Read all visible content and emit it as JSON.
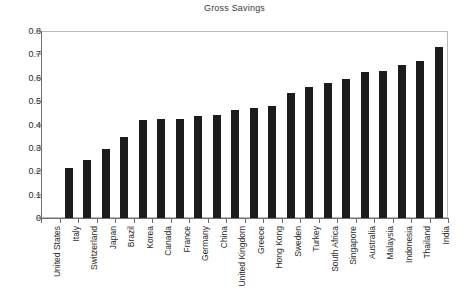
{
  "chart_data": {
    "type": "bar",
    "title": "Gross Savings",
    "xlabel": "",
    "ylabel": "",
    "ylim": [
      0,
      0.8
    ],
    "yticks": [
      0,
      0.1,
      0.2,
      0.3,
      0.4,
      0.5,
      0.6,
      0.7,
      0.8
    ],
    "ytick_labels": [
      "0",
      "0.1",
      "0.2",
      "0.3",
      "0.4",
      "0.5",
      "0.6",
      "0.7",
      "0.8"
    ],
    "grid": false,
    "legend": null,
    "bar_color": "#1c1c1c",
    "categories": [
      "United States",
      "Italy",
      "Switzerland",
      "Japan",
      "Brazil",
      "Korea",
      "Canada",
      "France",
      "Germany",
      "China",
      "United Kingdom",
      "Greece",
      "Hong Kong",
      "Sweden",
      "Turkey",
      "South Africa",
      "Singapore",
      "Australia",
      "Malaysia",
      "Indonesia",
      "Thailand",
      "India"
    ],
    "values": [
      0,
      0.215,
      0.25,
      0.295,
      0.345,
      0.42,
      0.423,
      0.423,
      0.437,
      0.44,
      0.46,
      0.472,
      0.478,
      0.535,
      0.562,
      0.578,
      0.594,
      0.623,
      0.631,
      0.653,
      0.673,
      0.733
    ]
  }
}
